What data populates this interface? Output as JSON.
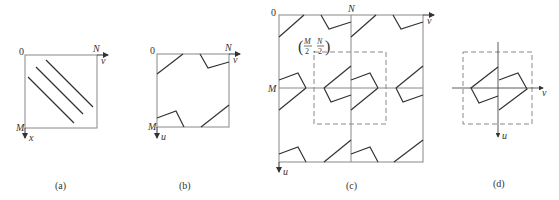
{
  "panels": {
    "a": {
      "caption": "(a)",
      "origin_label": "0",
      "right_label": "N",
      "bottom_label": "M",
      "h_axis_label": "v",
      "v_axis_label": "x"
    },
    "b": {
      "caption": "(b)",
      "origin_label": "0",
      "right_label": "N",
      "bottom_label": "M",
      "h_axis_label": "v",
      "v_axis_label": "u"
    },
    "c": {
      "caption": "(c)",
      "origin_label": "0",
      "top_mid_label": "N",
      "left_mid_label": "M",
      "h_axis_label": "v",
      "v_axis_label": "u",
      "center_label_M": "M",
      "center_label_N": "N",
      "center_label_den": "2"
    },
    "d": {
      "caption": "(d)",
      "h_axis_label": "v",
      "v_axis_label": "u"
    }
  },
  "colors": {
    "stroke": "#333333",
    "frame": "#888888",
    "dash": "#888888"
  }
}
